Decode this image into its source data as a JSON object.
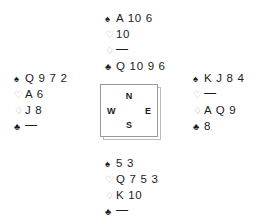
{
  "diagram": {
    "type": "bridge-deal",
    "suit_symbols": {
      "spades": "♠",
      "hearts": "♡",
      "diamonds": "♢",
      "clubs": "♣"
    },
    "void_mark": "—",
    "colors": {
      "text": "#1b1b1b",
      "hollow_suit": "#a8a8a8",
      "box_border": "#9a9a9a",
      "box_shadow": "#bdbdbd",
      "background": "#ffffff"
    }
  },
  "compass": {
    "north_label": "N",
    "south_label": "S",
    "west_label": "W",
    "east_label": "E"
  },
  "hands": {
    "north": {
      "seat": "North",
      "spades": "A 10 6",
      "hearts": "10",
      "diamonds": "—",
      "clubs": "Q 10 9 6"
    },
    "west": {
      "seat": "West",
      "spades": "Q 9 7 2",
      "hearts": "A 6",
      "diamonds": "J 8",
      "clubs": "—"
    },
    "east": {
      "seat": "East",
      "spades": "K J 8 4",
      "hearts": "—",
      "diamonds": "A Q 9",
      "clubs": "8"
    },
    "south": {
      "seat": "South",
      "spades": "5 3",
      "hearts": "Q 7 5 3",
      "diamonds": "K 10",
      "clubs": "—"
    }
  }
}
